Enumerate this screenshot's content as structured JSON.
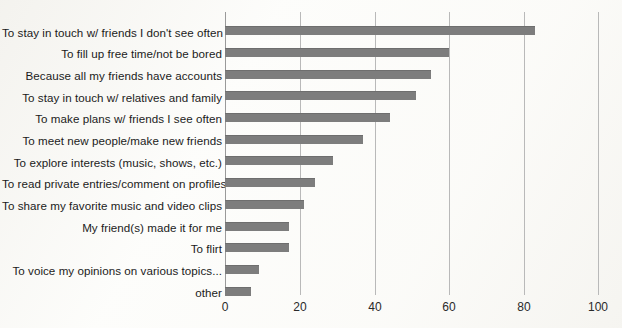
{
  "chart_data": {
    "type": "bar",
    "orientation": "horizontal",
    "title": "",
    "subtitle": "",
    "xlabel": "",
    "ylabel": "",
    "xlim": [
      0,
      100
    ],
    "xticks": [
      0,
      20,
      40,
      60,
      80,
      100
    ],
    "grid": true,
    "legend": false,
    "bar_color": "#7d7d7d",
    "gridline_color": "#b9b9b9",
    "background_color": "#fdfdfb",
    "categories": [
      "To stay in touch w/ friends I don't see often",
      "To fill up free time/not be bored",
      "Because all my friends have accounts",
      "To stay in touch w/ relatives and family",
      "To make plans w/ friends I see often",
      "To meet new people/make new friends",
      "To explore interests (music, shows, etc.)",
      "To read private entries/comment on profiles",
      "To share my favorite music and video clips",
      "My friend(s) made it for me",
      "To flirt",
      "To voice my opinions on various topics...",
      "other"
    ],
    "values": [
      83,
      60,
      55,
      51,
      44,
      37,
      29,
      24,
      21,
      17,
      17,
      9,
      7
    ]
  }
}
